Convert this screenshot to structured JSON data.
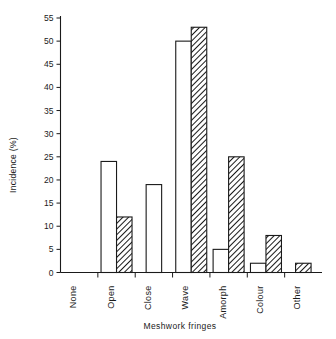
{
  "chart_data": {
    "type": "bar",
    "title": "",
    "xlabel": "Meshwork  fringes",
    "ylabel": "Incidence (%)",
    "categories": [
      "None",
      "Open",
      "Close",
      "Wave",
      "Amorph",
      "Colour",
      "Other"
    ],
    "series": [
      {
        "name": "open",
        "style": "white",
        "values": [
          0,
          24,
          19,
          50,
          5,
          2,
          0
        ]
      },
      {
        "name": "hatched",
        "style": "hatched",
        "values": [
          0,
          12,
          0,
          53,
          25,
          8,
          2
        ]
      }
    ],
    "ylim": [
      0,
      55
    ],
    "ytick_step": 5,
    "yticks": [
      "0",
      "5",
      "10",
      "15",
      "20",
      "25",
      "30",
      "35",
      "40",
      "45",
      "50",
      "55"
    ],
    "grid": false,
    "legend": "none",
    "colors": {
      "axis": "#1a1a1a",
      "bar_white_fill": "#ffffff",
      "bar_white_stroke": "#1a1a1a",
      "bar_hatch_stroke": "#1a1a1a",
      "background": "#ffffff"
    }
  }
}
